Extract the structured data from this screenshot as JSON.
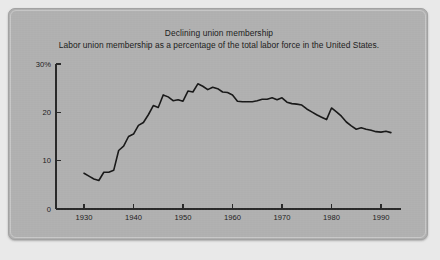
{
  "figure": {
    "panel_background": "#b2b2b2",
    "page_background": "#e9e9e9",
    "line_color": "#1a1a1a",
    "axis_color": "#2b2b2b",
    "caption_partial": ""
  },
  "chart_data": {
    "type": "line",
    "title": "Declining union membership",
    "subtitle": "Labor union membership as a percentage of the total labor force in the United States.",
    "xlabel": "",
    "ylabel": "",
    "xlim": [
      1930,
      1992
    ],
    "ylim": [
      0,
      30
    ],
    "grid": false,
    "legend": "none",
    "y_ticks": [
      "30%",
      "20",
      "10",
      "0"
    ],
    "y_tick_values": [
      30,
      20,
      10,
      0
    ],
    "x_ticks": [
      "1930",
      "1940",
      "1950",
      "1960",
      "1970",
      "1980",
      "1990"
    ],
    "x_tick_values": [
      1930,
      1940,
      1950,
      1960,
      1970,
      1980,
      1990
    ],
    "series": [
      {
        "name": "Union membership share of labor force",
        "x": [
          1930,
          1931,
          1932,
          1933,
          1934,
          1935,
          1936,
          1937,
          1938,
          1939,
          1940,
          1941,
          1942,
          1943,
          1944,
          1945,
          1946,
          1947,
          1948,
          1949,
          1950,
          1951,
          1952,
          1953,
          1954,
          1955,
          1956,
          1957,
          1958,
          1959,
          1960,
          1961,
          1962,
          1963,
          1964,
          1965,
          1966,
          1967,
          1968,
          1969,
          1970,
          1971,
          1972,
          1973,
          1974,
          1975,
          1976,
          1977,
          1978,
          1979,
          1980,
          1981,
          1982,
          1983,
          1984,
          1985,
          1986,
          1987,
          1988,
          1989,
          1990,
          1991,
          1992
        ],
        "y": [
          7.4,
          6.8,
          6.2,
          5.9,
          7.6,
          7.6,
          8.0,
          12.1,
          13.0,
          15.0,
          15.5,
          17.3,
          17.9,
          19.5,
          21.4,
          21.0,
          23.6,
          23.2,
          22.4,
          22.6,
          22.3,
          24.4,
          24.2,
          25.9,
          25.4,
          24.7,
          25.2,
          24.9,
          24.2,
          24.1,
          23.6,
          22.3,
          22.2,
          22.2,
          22.2,
          22.4,
          22.7,
          22.7,
          23.0,
          22.6,
          23.0,
          22.1,
          21.8,
          21.7,
          21.5,
          20.7,
          20.1,
          19.5,
          19.0,
          18.5,
          20.9,
          20.1,
          19.2,
          18.0,
          17.2,
          16.5,
          16.8,
          16.5,
          16.3,
          16.0,
          15.9,
          16.1,
          15.8
        ]
      }
    ]
  }
}
